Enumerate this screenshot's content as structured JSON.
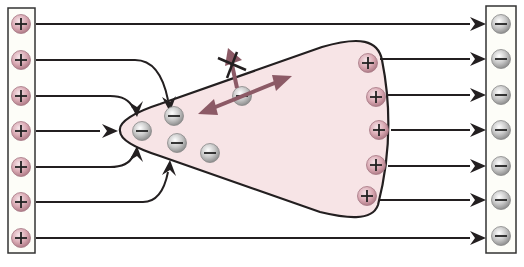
{
  "diagram": {
    "colors": {
      "line": "#231f20",
      "body_fill": "#f7e4e6",
      "plus_fill": "#dcaab4",
      "minus_fill": "#c8c8c8",
      "motion_arrow": "#8c5a66",
      "plate_fill": "#fdfdf8"
    },
    "left_plate": {
      "label": "positive-plate",
      "x": 8,
      "y": 8,
      "w": 27,
      "h": 245,
      "charges": [
        {
          "sign": "+",
          "cx": 21,
          "cy": 24
        },
        {
          "sign": "+",
          "cx": 21,
          "cy": 60
        },
        {
          "sign": "+",
          "cx": 21,
          "cy": 96
        },
        {
          "sign": "+",
          "cx": 21,
          "cy": 131
        },
        {
          "sign": "+",
          "cx": 21,
          "cy": 167
        },
        {
          "sign": "+",
          "cx": 21,
          "cy": 202
        },
        {
          "sign": "+",
          "cx": 21,
          "cy": 238
        }
      ]
    },
    "right_plate": {
      "label": "negative-plate",
      "x": 486,
      "y": 6,
      "w": 30,
      "h": 247,
      "charges": [
        {
          "sign": "-",
          "cx": 501,
          "cy": 24
        },
        {
          "sign": "-",
          "cx": 501,
          "cy": 59
        },
        {
          "sign": "-",
          "cx": 501,
          "cy": 95
        },
        {
          "sign": "-",
          "cx": 501,
          "cy": 130
        },
        {
          "sign": "-",
          "cx": 501,
          "cy": 166
        },
        {
          "sign": "-",
          "cx": 501,
          "cy": 200
        },
        {
          "sign": "-",
          "cx": 501,
          "cy": 236
        }
      ]
    },
    "body_charges": [
      {
        "sign": "-",
        "cx": 142,
        "cy": 131
      },
      {
        "sign": "-",
        "cx": 174,
        "cy": 116
      },
      {
        "sign": "-",
        "cx": 177,
        "cy": 143
      },
      {
        "sign": "-",
        "cx": 210,
        "cy": 153
      },
      {
        "sign": "-",
        "cx": 242,
        "cy": 96
      },
      {
        "sign": "+",
        "cx": 368,
        "cy": 63
      },
      {
        "sign": "+",
        "cx": 376,
        "cy": 97
      },
      {
        "sign": "+",
        "cx": 379,
        "cy": 130
      },
      {
        "sign": "+",
        "cx": 376,
        "cy": 165
      },
      {
        "sign": "+",
        "cx": 367,
        "cy": 196
      }
    ],
    "field_lines": [
      {
        "d": "M36 24 L470 24",
        "arrow_end": [
          486,
          24
        ],
        "arrow_dir": "right"
      },
      {
        "d": "M36 60 L135 60 Q160 60 168 100",
        "arrow_end": [
          170,
          112
        ],
        "arrow_dir": "down"
      },
      {
        "d": "M36 96 L110 96 Q128 96 133 108",
        "arrow_end": [
          137,
          117
        ],
        "arrow_dir": "down"
      },
      {
        "d": "M36 131 L100 131",
        "arrow_end": [
          118,
          131
        ],
        "arrow_dir": "right"
      },
      {
        "d": "M36 167 L110 167 Q128 167 133 156",
        "arrow_end": [
          137,
          146
        ],
        "arrow_dir": "up"
      },
      {
        "d": "M36 202 L143 202 Q162 202 168 172",
        "arrow_end": [
          170,
          160
        ],
        "arrow_dir": "up"
      },
      {
        "d": "M36 238 L470 238",
        "arrow_end": [
          486,
          238
        ],
        "arrow_dir": "right"
      },
      {
        "d": "M380 59 L470 59",
        "arrow_end": [
          486,
          59
        ],
        "arrow_dir": "right"
      },
      {
        "d": "M388 95 L470 95",
        "arrow_end": [
          486,
          95
        ],
        "arrow_dir": "right"
      },
      {
        "d": "M391 130 L470 130",
        "arrow_end": [
          486,
          130
        ],
        "arrow_dir": "right"
      },
      {
        "d": "M388 166 L470 166",
        "arrow_end": [
          486,
          166
        ],
        "arrow_dir": "right"
      },
      {
        "d": "M380 200 L470 200",
        "arrow_end": [
          486,
          200
        ],
        "arrow_dir": "right"
      }
    ],
    "body_path": "M120 131 C 118 122, 135 112, 160 104 L 322 47 C 360 36, 378 40, 382 60 C 390 100, 392 150, 378 205 C 372 222, 345 218, 320 212 L 160 156 C 135 148, 120 140, 120 131 Z",
    "blocked_arrow": {
      "label": "blocked-escape-arrow",
      "from": [
        237,
        88
      ],
      "to": [
        228,
        48
      ]
    },
    "motion_arrow": {
      "label": "electron-motion-double-arrow",
      "from": [
        198,
        114
      ],
      "to": [
        292,
        76
      ]
    }
  }
}
